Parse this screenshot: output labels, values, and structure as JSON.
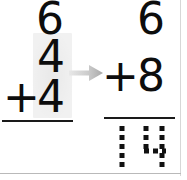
{
  "worksheet": {
    "title": "Two-digit addition worksheet step",
    "background_color": "#ffffff",
    "ink_color": "#0d0d0d",
    "highlight_color": "rgba(0,0,0,0.055)",
    "arrow_color": "#b6b6b6"
  },
  "problem_left": {
    "name": "left-addition-problem",
    "addend_top": "6",
    "addend_middle": "4",
    "operator": "+",
    "addend_bottom": "4",
    "answer": "",
    "highlight_note": "ones column highlighted"
  },
  "problem_right": {
    "name": "right-addition-problem",
    "addend_top": "6",
    "operator": "+",
    "addend_bottom": "8",
    "answer": "14",
    "answer_style": "dashed-trace"
  },
  "annotations": {
    "arrow_icon": "arrow-right-icon",
    "arrow_direction": "right"
  }
}
